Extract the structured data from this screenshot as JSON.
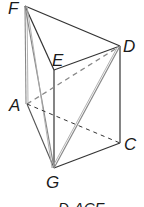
{
  "figure": {
    "type": "geometric-solid",
    "vertices": {
      "F": "F",
      "E": "E",
      "D": "D",
      "A": "A",
      "C": "C",
      "G": "G"
    },
    "solid_edges": [
      "F-E",
      "F-D",
      "E-D",
      "F-A",
      "F-G",
      "E-G",
      "D-C",
      "D-G",
      "A-G",
      "G-C"
    ],
    "dashed_edges": [
      "A-D",
      "A-C"
    ],
    "caption": "D-ACF",
    "colors": {
      "line": "#333333",
      "shaded_line": "#888888",
      "background": "#ffffff"
    }
  }
}
